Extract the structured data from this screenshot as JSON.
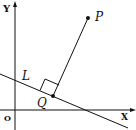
{
  "diagram": {
    "axes": {
      "x_label": "X",
      "y_label": "Y",
      "origin_label": "O"
    },
    "line_label": "L",
    "points": [
      {
        "name": "P",
        "label": "P"
      },
      {
        "name": "Q",
        "label": "Q"
      }
    ],
    "relations": [
      "PQ perpendicular to line L",
      "Q lies on L"
    ],
    "colors": {
      "stroke": "#111111",
      "background": "#ffffff"
    }
  }
}
